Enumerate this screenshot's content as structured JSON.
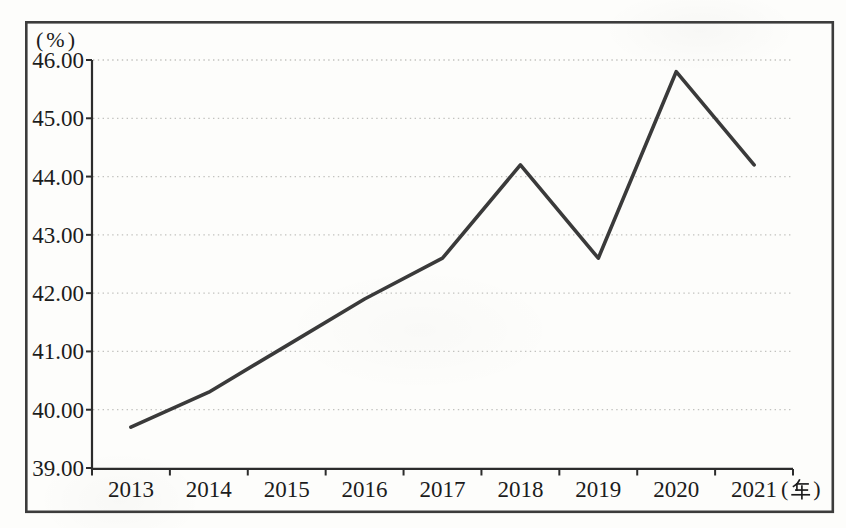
{
  "figure": {
    "y_unit_label": "(%)",
    "x_unit_text": "(年)",
    "x_unit_open": "(",
    "x_unit_close": ")"
  },
  "chart_data": {
    "type": "line",
    "title": "",
    "categories": [
      "2013",
      "2014",
      "2015",
      "2016",
      "2017",
      "2018",
      "2019",
      "2020",
      "2021"
    ],
    "values": [
      39.7,
      40.3,
      41.1,
      41.9,
      42.6,
      44.2,
      42.6,
      45.8,
      44.2
    ],
    "xlabel": "(年)",
    "ylabel": "(%)",
    "ylim": [
      39,
      46
    ],
    "y_tick_step": 1.0,
    "y_ticks": [
      "46.00",
      "45.00",
      "44.00",
      "43.00",
      "42.00",
      "41.00",
      "40.00",
      "39.00"
    ],
    "grid": "horizontal-dotted",
    "legend": "none",
    "markers": "none",
    "style": {
      "line_color": "#3a3a3a",
      "axis_color": "#2c2c2c",
      "grid_color": "#c2c2bf",
      "frame_color": "#3c3c3c",
      "text_color": "#1c1c1c",
      "background": "#fdfdfb"
    }
  }
}
